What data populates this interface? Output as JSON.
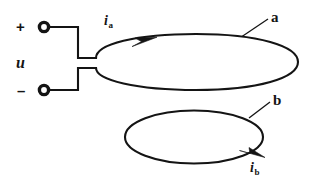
{
  "figure": {
    "stroke_color": "#141414",
    "background_color": "#ffffff",
    "labels": {
      "plus": "+",
      "minus": "–",
      "voltage": "u",
      "coil_a": "a",
      "coil_b": "b",
      "current_a": "i",
      "current_a_sub": "a",
      "current_b": "i",
      "current_b_sub": "b"
    },
    "geometry": {
      "terminal_top": {
        "cx": 44,
        "cy": 27,
        "r": 5
      },
      "terminal_bottom": {
        "cx": 44,
        "cy": 90,
        "r": 5
      },
      "ellipse_a": {
        "cx": 196,
        "cy": 62,
        "rx": 102,
        "ry": 28
      },
      "ellipse_b": {
        "cx": 194,
        "cy": 137,
        "rx": 70,
        "ry": 27
      }
    }
  }
}
